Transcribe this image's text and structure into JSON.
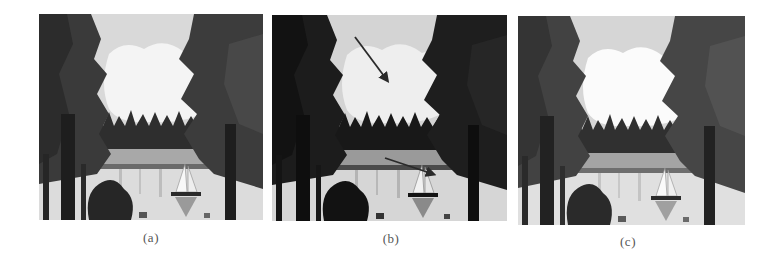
{
  "figure": {
    "panels": [
      {
        "id": "a",
        "caption": "(a)",
        "description": "Grayscale lake scene with pine trees, cloudy sky, treeline and sailboat",
        "tone": {
          "sky": "#d9d9d9",
          "cloud": "#f4f4f4",
          "trees": "#3a3a3a",
          "treeline": "#2e2e2e",
          "shore": "#a8a8a8",
          "water": "#dcdcdc",
          "trunk": "#1e1e1e"
        }
      },
      {
        "id": "b",
        "caption": "(b)",
        "description": "Same scene, darker with higher contrast; two arrows point to cloud region and sailboat",
        "tone": {
          "sky": "#d4d4d4",
          "cloud": "#eeeeee",
          "trees": "#1c1c1c",
          "treeline": "#181818",
          "shore": "#9a9a9a",
          "water": "#d6d6d6",
          "trunk": "#0e0e0e"
        },
        "arrows": [
          {
            "from": [
              83,
              22
            ],
            "to": [
              117,
              68
            ]
          },
          {
            "from": [
              113,
              143
            ],
            "to": [
              164,
              160
            ]
          }
        ]
      },
      {
        "id": "c",
        "caption": "(c)",
        "description": "Same scene, enhanced result with brighter cloud and smoother tones",
        "tone": {
          "sky": "#d6d6d6",
          "cloud": "#fbfbfb",
          "trees": "#424242",
          "treeline": "#303030",
          "shore": "#a4a4a4",
          "water": "#e0e0e0",
          "trunk": "#222222"
        }
      }
    ]
  }
}
